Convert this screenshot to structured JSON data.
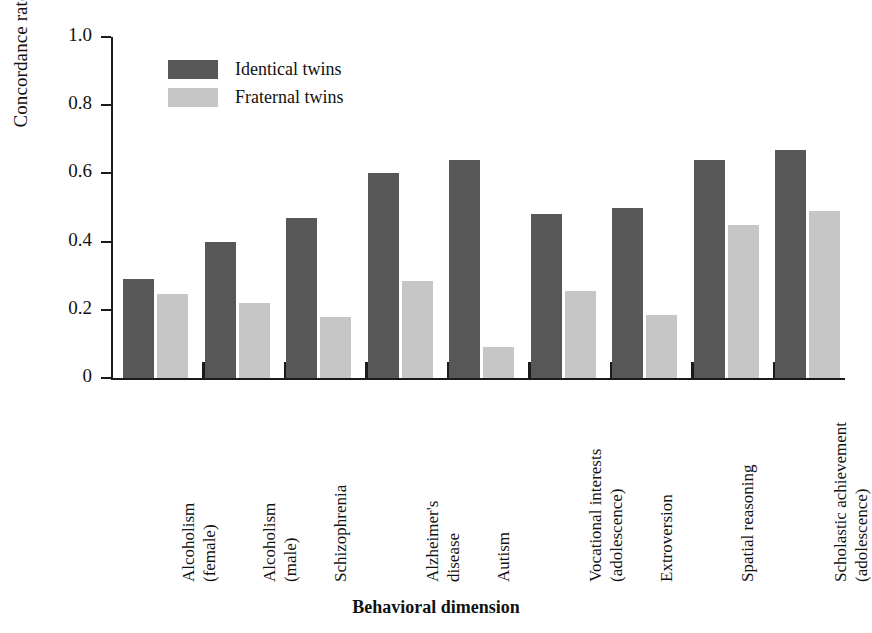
{
  "chart_data": {
    "type": "bar",
    "title": "",
    "xlabel": "Behavioral dimension",
    "ylabel": "Concordance rate",
    "ylim": [
      0,
      1.0
    ],
    "ytick_labels": [
      "1.0",
      "0.8",
      "0.6",
      "0.4",
      "0.2",
      "0"
    ],
    "ytick_values": [
      1.0,
      0.8,
      0.6,
      0.4,
      0.2,
      0
    ],
    "grid": false,
    "legend_position": "top-left-inside",
    "categories": [
      "Alcoholism\n(female)",
      "Alcoholism\n(male)",
      "Schizophrenia",
      "Alzheimer's\ndisease",
      "Autism",
      "Vocational interests\n(adolescence)",
      "Extroversion",
      "Spatial reasoning",
      "Scholastic achievement\n(adolescence)"
    ],
    "category_lines": [
      [
        "Alcoholism",
        "(female)"
      ],
      [
        "Alcoholism",
        "(male)"
      ],
      [
        "Schizophrenia"
      ],
      [
        "Alzheimer's",
        "disease"
      ],
      [
        "Autism"
      ],
      [
        "Vocational interests",
        "(adolescence)"
      ],
      [
        "Extroversion"
      ],
      [
        "Spatial reasoning"
      ],
      [
        "Scholastic achievement",
        "(adolescence)"
      ]
    ],
    "series": [
      {
        "name": "Identical twins",
        "color": "#575757",
        "values": [
          0.29,
          0.4,
          0.47,
          0.6,
          0.64,
          0.48,
          0.5,
          0.64,
          0.67
        ]
      },
      {
        "name": "Fraternal twins",
        "color": "#c6c6c6",
        "values": [
          0.245,
          0.22,
          0.18,
          0.285,
          0.09,
          0.255,
          0.185,
          0.45,
          0.49
        ]
      }
    ]
  },
  "legend": {
    "items": [
      {
        "label": "Identical twins",
        "color": "#575757"
      },
      {
        "label": "Fraternal twins",
        "color": "#c6c6c6"
      }
    ]
  },
  "axes": {
    "y_title": "Concordance rate",
    "x_title": "Behavioral dimension"
  }
}
